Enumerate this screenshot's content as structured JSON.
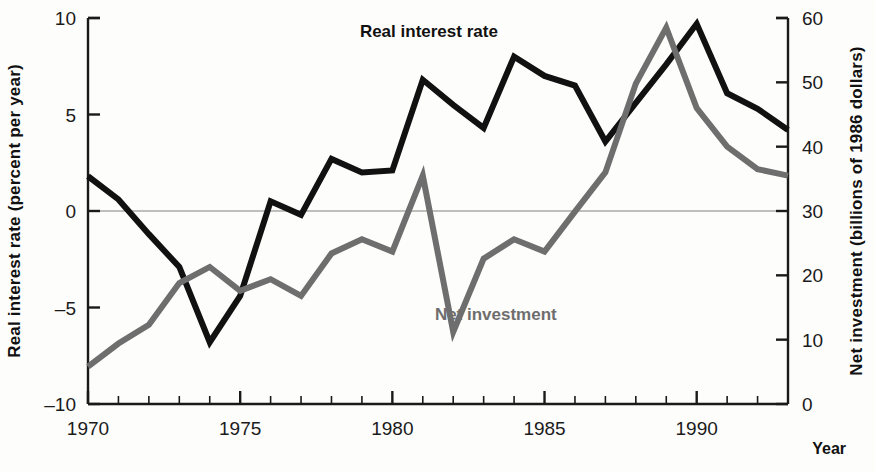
{
  "chart_data": {
    "type": "line",
    "title": "",
    "xlabel": "Year",
    "x": [
      1970,
      1971,
      1972,
      1973,
      1974,
      1975,
      1976,
      1977,
      1978,
      1979,
      1980,
      1981,
      1982,
      1983,
      1984,
      1985,
      1986,
      1987,
      1988,
      1989,
      1990,
      1991,
      1992,
      1993
    ],
    "xlim": [
      1970,
      1993
    ],
    "xticks": [
      1970,
      1975,
      1980,
      1985,
      1990
    ],
    "xtick_labels": [
      "1970",
      "1975",
      "1980",
      "1985",
      "1990"
    ],
    "minor_tick_step": 1,
    "grid": false,
    "zero_line": true,
    "legend": "inline-labels",
    "axes": [
      {
        "id": "left",
        "label": "Real interest rate (percent per year)",
        "lim": [
          -10,
          10
        ],
        "ticks": [
          -10,
          -5,
          0,
          5,
          10
        ],
        "tick_labels": [
          "-10",
          "-5",
          "0",
          "5",
          "10"
        ]
      },
      {
        "id": "right",
        "label": "Net investment (billions of 1986 dollars)",
        "lim": [
          0,
          60
        ],
        "ticks": [
          0,
          10,
          20,
          30,
          40,
          50,
          60
        ],
        "tick_labels": [
          "0",
          "10",
          "20",
          "30",
          "40",
          "50",
          "60"
        ]
      }
    ],
    "series": [
      {
        "name": "Real interest rate",
        "axis": "left",
        "color": "#111111",
        "width": 6,
        "label_x": 1981.2,
        "label_y": 9.0,
        "values": [
          1.8,
          0.6,
          -1.2,
          -2.9,
          -6.8,
          -4.4,
          0.5,
          -0.2,
          2.7,
          2.0,
          2.1,
          6.8,
          5.5,
          4.3,
          8.0,
          7.0,
          6.5,
          3.6,
          5.6,
          7.6,
          9.7,
          6.1,
          5.3,
          4.2
        ]
      },
      {
        "name": "Net investment",
        "axis": "right",
        "color": "#6e6e6e",
        "width": 6,
        "label_x": 1983.4,
        "label_y": 13.0,
        "values": [
          5.8,
          9.4,
          12.3,
          18.8,
          21.3,
          17.6,
          19.4,
          16.8,
          23.4,
          25.6,
          23.7,
          35.5,
          11.2,
          22.6,
          25.6,
          23.7,
          29.9,
          36.0,
          49.8,
          58.5,
          46.0,
          40.0,
          36.5,
          35.5
        ]
      }
    ]
  },
  "series_labels": {
    "real_interest_rate": "Real interest rate",
    "net_investment": "Net investment"
  },
  "axis_titles": {
    "left": "Real interest rate (percent per year)",
    "right": "Net investment (billions of 1986 dollars)",
    "x": "Year"
  }
}
